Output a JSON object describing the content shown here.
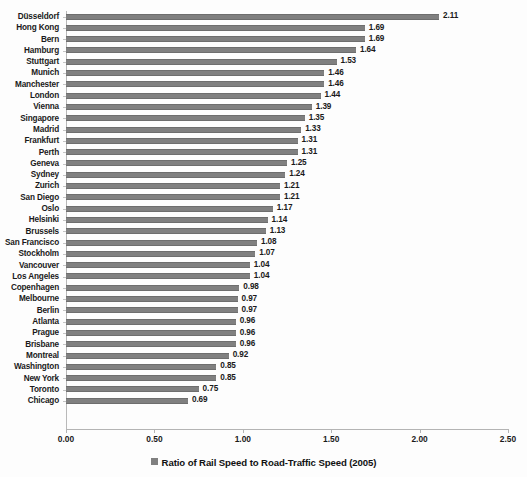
{
  "chart_data": {
    "type": "bar",
    "orientation": "horizontal",
    "title": "",
    "subtitle": "",
    "xlabel": "",
    "ylabel": "",
    "xlim": [
      0.0,
      2.5
    ],
    "xticks": [
      "0.00",
      "0.50",
      "1.00",
      "1.50",
      "2.00",
      "2.50"
    ],
    "xtick_values": [
      0.0,
      0.5,
      1.0,
      1.5,
      2.0,
      2.5
    ],
    "grid": false,
    "legend_position": "bottom",
    "legend": [
      "Ratio of Rail Speed to Road-Traffic Speed (2005)"
    ],
    "series_name": "Ratio of Rail Speed to Road-Traffic Speed (2005)",
    "bar_color": "#808080",
    "categories": [
      "Düsseldorf",
      "Hong Kong",
      "Bern",
      "Hamburg",
      "Stuttgart",
      "Munich",
      "Manchester",
      "London",
      "Vienna",
      "Singapore",
      "Madrid",
      "Frankfurt",
      "Perth",
      "Geneva",
      "Sydney",
      "Zurich",
      "San Diego",
      "Oslo",
      "Helsinki",
      "Brussels",
      "San Francisco",
      "Stockholm",
      "Vancouver",
      "Los Angeles",
      "Copenhagen",
      "Melbourne",
      "Berlin",
      "Atlanta",
      "Prague",
      "Brisbane",
      "Montreal",
      "Washington",
      "New York",
      "Toronto",
      "Chicago"
    ],
    "values": [
      2.11,
      1.69,
      1.69,
      1.64,
      1.53,
      1.46,
      1.46,
      1.44,
      1.39,
      1.35,
      1.33,
      1.31,
      1.31,
      1.25,
      1.24,
      1.21,
      1.21,
      1.17,
      1.14,
      1.13,
      1.08,
      1.07,
      1.04,
      1.04,
      0.98,
      0.97,
      0.97,
      0.96,
      0.96,
      0.96,
      0.92,
      0.85,
      0.85,
      0.75,
      0.69
    ],
    "value_labels": [
      "2.11",
      "1.69",
      "1.69",
      "1.64",
      "1.53",
      "1.46",
      "1.46",
      "1.44",
      "1.39",
      "1.35",
      "1.33",
      "1.31",
      "1.31",
      "1.25",
      "1.24",
      "1.21",
      "1.21",
      "1.17",
      "1.14",
      "1.13",
      "1.08",
      "1.07",
      "1.04",
      "1.04",
      "0.98",
      "0.97",
      "0.97",
      "0.96",
      "0.96",
      "0.96",
      "0.92",
      "0.85",
      "0.85",
      "0.75",
      "0.69"
    ]
  }
}
